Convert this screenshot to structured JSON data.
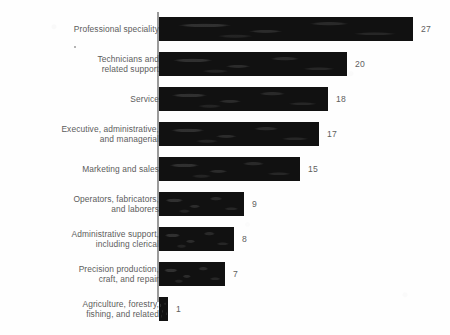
{
  "chart_data": {
    "type": "bar",
    "orientation": "horizontal",
    "title": "",
    "subtitle": "",
    "xlabel": "",
    "ylabel": "",
    "grid": false,
    "legend": null,
    "xlim": [
      0,
      27
    ],
    "axis_line": "vertical category axis at left of bars",
    "value_label_position": "right of bar end",
    "categories": [
      "Professional speciality",
      "Technicians and\nrelated support",
      "Service",
      "Executive, administrative,\nand managerial",
      "Marketing and sales",
      "Operators, fabricators,\nand laborers",
      "Administrative support,\nincluding clerical",
      "Precision production,\ncraft, and repair",
      "Agriculture, forestry,\nfishing, and related"
    ],
    "values": [
      27,
      20,
      18,
      17,
      15,
      9,
      8,
      7,
      1
    ],
    "value_labels": [
      "27",
      "20",
      "18",
      "17",
      "15",
      "9",
      "8",
      "7",
      "1"
    ],
    "colors": {
      "bar": "#111111",
      "axis": "#9a9a9a",
      "label_text": "#5c5c5c",
      "value_text": "#5e5e5e",
      "background": "#fefefe"
    }
  }
}
